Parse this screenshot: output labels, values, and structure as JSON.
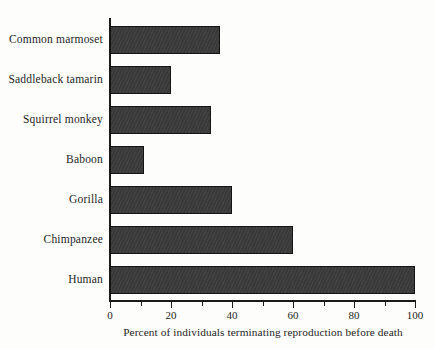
{
  "chart_data": {
    "type": "bar",
    "orientation": "horizontal",
    "title": "",
    "subtitle": "",
    "xlabel": "Percent of individuals terminating reproduction before death",
    "ylabel": "",
    "categories": [
      "Common marmoset",
      "Saddleback tamarin",
      "Squirrel monkey",
      "Baboon",
      "Gorilla",
      "Chimpanzee",
      "Human"
    ],
    "values": [
      36,
      20,
      33,
      11,
      40,
      60,
      100
    ],
    "xlim": [
      0,
      100
    ],
    "xticks": [
      0,
      20,
      40,
      60,
      80,
      100
    ],
    "xtick_labels": [
      "0",
      "20",
      "40",
      "60",
      "80",
      "100"
    ],
    "minor_tick_step": 10,
    "grid": false,
    "legend": null,
    "bar_color": "#3c3c3c",
    "bar_edge_color": "#141414",
    "axis_color": "#1a1a1a",
    "background_color": "#fdfdfb",
    "text_color": "#252525"
  }
}
